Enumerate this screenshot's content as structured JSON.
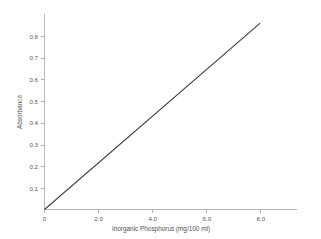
{
  "chart_data": {
    "type": "line",
    "title": "",
    "xlabel": "Inorganic Phosphorus (mg/100 ml)",
    "ylabel": "Absorbance",
    "xlim": [
      0,
      9.6
    ],
    "ylim": [
      0,
      0.855
    ],
    "grid": false,
    "legend": null,
    "xticks": [
      0,
      2.0,
      4.0,
      6.0,
      8.0
    ],
    "xticklabels": [
      "0",
      "2.0",
      "4.0",
      "6.0",
      "8.0"
    ],
    "yticks": [
      0.1,
      0.2,
      0.3,
      0.4,
      0.5,
      0.6,
      0.7,
      0.8
    ],
    "yticklabels": [
      "0.1",
      "0.2",
      "0.3",
      "0.4",
      "0.5",
      "0.6",
      "0.7",
      "0.8"
    ],
    "series": [
      {
        "name": "Standard curve",
        "x": [
          0,
          8.2
        ],
        "y": [
          0,
          0.815
        ],
        "color": "#3c3c3e",
        "slope": 0.0994,
        "intercept": 0
      }
    ]
  },
  "axes": {
    "x_title": "Inorganic Phosphorus (mg/100 ml)",
    "y_title": "Absorbance",
    "x_tick_text": [
      "0",
      "2.0",
      "4.0",
      "6.0",
      "8.0"
    ],
    "y_tick_text": [
      "0.8",
      "0.7",
      "0.6",
      "0.5",
      "0.4",
      "0.3",
      "0.2",
      "0.1"
    ],
    "axis_color": "#b9b9bb",
    "line_color": "#3c3c3e",
    "background": "#ffffff"
  }
}
